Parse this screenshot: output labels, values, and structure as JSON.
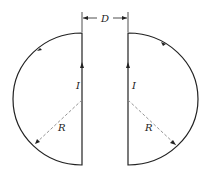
{
  "diagram": {
    "separation_label": "D",
    "left_loop": {
      "current_label": "I",
      "radius_label": "R"
    },
    "right_loop": {
      "current_label": "I",
      "radius_label": "R"
    },
    "colors": {
      "line": "#222222",
      "dashed": "#888888"
    }
  }
}
